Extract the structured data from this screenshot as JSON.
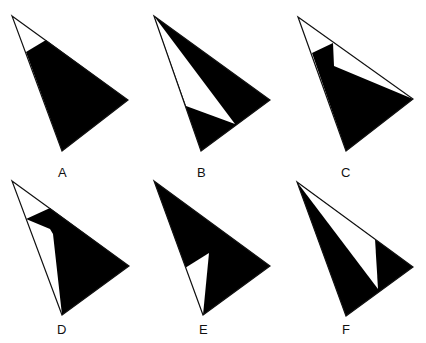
{
  "diagram": {
    "type": "triangle-shading-options",
    "fill_color": "#000000",
    "stroke_color": "#111111",
    "background": "#ffffff",
    "options": [
      {
        "label": "A",
        "outline": "12,16 128,100 62,151",
        "shapes": [
          {
            "fill": "#000000",
            "points": "26,52 46,40 128,100 62,151"
          }
        ],
        "label_pos": [
          58,
          177
        ]
      },
      {
        "label": "B",
        "outline": "154,16 270,100 201,151",
        "shapes": [
          {
            "fill": "#000000",
            "points": "154,16 270,100 201,151"
          },
          {
            "fill": "#ffffff",
            "points": "154,16 186,106 235,124"
          }
        ],
        "label_pos": [
          197,
          177
        ]
      },
      {
        "label": "C",
        "outline": "298,17 413,99 346,151",
        "shapes": [
          {
            "fill": "#000000",
            "points": "312,53 333,43 334,66 413,99 346,151"
          }
        ],
        "label_pos": [
          341,
          177
        ]
      },
      {
        "label": "D",
        "outline": "12,181 129,266 62,315",
        "shapes": [
          {
            "fill": "#000000",
            "points": "26,219 50,208 129,266 62,315 53,234 50,229"
          }
        ],
        "label_pos": [
          57,
          334
        ]
      },
      {
        "label": "E",
        "outline": "154,181 270,266 203,315",
        "shapes": [
          {
            "fill": "#000000",
            "points": "154,181 270,266 203,315"
          },
          {
            "fill": "#ffffff",
            "points": "185,268 209,253 203,315"
          }
        ],
        "label_pos": [
          199,
          334
        ]
      },
      {
        "label": "F",
        "outline": "297,182 413,267 346,316",
        "shapes": [
          {
            "fill": "#000000",
            "points": "297,182 413,267 346,316"
          },
          {
            "fill": "#ffffff",
            "points": "297,182 375,239 378,289"
          }
        ],
        "label_pos": [
          342,
          334
        ]
      }
    ]
  }
}
